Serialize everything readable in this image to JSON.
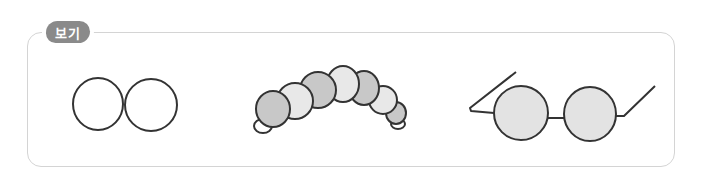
{
  "label": {
    "text": "보기"
  },
  "colors": {
    "stroke": "#333333",
    "box_border": "#d4d4d4",
    "label_bg": "#8a8a8a",
    "dark_fill": "#c8c8c8",
    "light_fill": "#e8e8e8",
    "lens_fill": "#e3e3e3",
    "white": "#ffffff"
  },
  "figures": [
    {
      "name": "two-circles",
      "description": "Two adjoining empty circles"
    },
    {
      "name": "caterpillar",
      "description": "Curved chain of alternating grey and light segments"
    },
    {
      "name": "glasses",
      "description": "Pair of round grey-filled spectacles with arms"
    }
  ]
}
